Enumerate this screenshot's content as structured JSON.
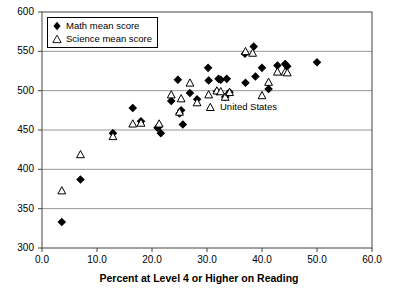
{
  "chart_data": {
    "type": "scatter",
    "title": "",
    "xlabel": "Percent at Level 4 or Higher on Reading",
    "ylabel": "",
    "xlim": [
      0.0,
      60.0
    ],
    "ylim": [
      300,
      600
    ],
    "xticks": [
      "0.0",
      "10.0",
      "20.0",
      "30.0",
      "40.0",
      "50.0",
      "60.0"
    ],
    "xtick_values": [
      0,
      10,
      20,
      30,
      40,
      50,
      60
    ],
    "yticks": [
      "300",
      "350",
      "400",
      "450",
      "500",
      "550",
      "600"
    ],
    "ytick_values": [
      300,
      350,
      400,
      450,
      500,
      550,
      600
    ],
    "grid": "horizontal",
    "legend_position": "top-left",
    "series": [
      {
        "name": "Math mean score",
        "marker": "filled-diamond",
        "color": "#000000",
        "points": [
          [
            3.6,
            333
          ],
          [
            7.0,
            387
          ],
          [
            12.9,
            446
          ],
          [
            16.5,
            478
          ],
          [
            18.0,
            461
          ],
          [
            21.0,
            453
          ],
          [
            21.3,
            455
          ],
          [
            21.6,
            446
          ],
          [
            23.5,
            487
          ],
          [
            24.7,
            514
          ],
          [
            25.0,
            471
          ],
          [
            25.3,
            475
          ],
          [
            25.6,
            457
          ],
          [
            26.9,
            497
          ],
          [
            28.2,
            489
          ],
          [
            30.2,
            529
          ],
          [
            30.3,
            513
          ],
          [
            31.8,
            499
          ],
          [
            32.1,
            515
          ],
          [
            32.5,
            514
          ],
          [
            33.3,
            492
          ],
          [
            33.6,
            515
          ],
          [
            34.1,
            498
          ],
          [
            36.9,
            547
          ],
          [
            37.0,
            510
          ],
          [
            38.5,
            556
          ],
          [
            38.8,
            518
          ],
          [
            40.0,
            529
          ],
          [
            41.2,
            502
          ],
          [
            42.8,
            532
          ],
          [
            44.2,
            534
          ],
          [
            44.6,
            531
          ],
          [
            50.0,
            536
          ]
        ]
      },
      {
        "name": "Science mean score",
        "marker": "open-triangle",
        "color": "#000000",
        "points": [
          [
            3.6,
            373
          ],
          [
            7.0,
            419
          ],
          [
            12.9,
            442
          ],
          [
            16.5,
            458
          ],
          [
            18.0,
            459
          ],
          [
            21.3,
            458
          ],
          [
            23.5,
            495
          ],
          [
            25.0,
            473
          ],
          [
            25.3,
            490
          ],
          [
            26.9,
            510
          ],
          [
            28.2,
            485
          ],
          [
            30.3,
            495
          ],
          [
            31.8,
            500
          ],
          [
            32.5,
            499
          ],
          [
            33.3,
            492
          ],
          [
            34.1,
            498
          ],
          [
            37.0,
            550
          ],
          [
            38.3,
            548
          ],
          [
            40.0,
            494
          ],
          [
            41.2,
            511
          ],
          [
            42.8,
            524
          ],
          [
            44.2,
            524
          ],
          [
            44.6,
            523
          ],
          [
            30.6,
            479
          ]
        ]
      }
    ],
    "annotations": [
      {
        "text": "United States",
        "x": 32.0,
        "y": 479
      }
    ]
  },
  "legend": {
    "items": [
      {
        "label": "Math mean score",
        "marker": "filled-diamond"
      },
      {
        "label": "Science mean score",
        "marker": "open-triangle"
      }
    ]
  },
  "axis": {
    "x_title": "Percent at Level 4 or Higher on Reading"
  }
}
